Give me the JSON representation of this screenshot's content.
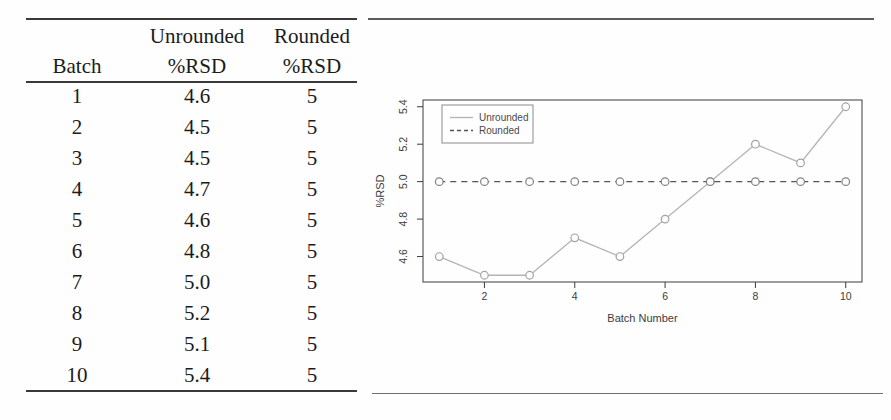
{
  "table": {
    "header": {
      "batch": "Batch",
      "unrounded_line1": "Unrounded",
      "unrounded_line2": "%RSD",
      "rounded_line1": "Rounded",
      "rounded_line2": "%RSD"
    },
    "rows": [
      {
        "batch": "1",
        "unrounded": "4.6",
        "rounded": "5"
      },
      {
        "batch": "2",
        "unrounded": "4.5",
        "rounded": "5"
      },
      {
        "batch": "3",
        "unrounded": "4.5",
        "rounded": "5"
      },
      {
        "batch": "4",
        "unrounded": "4.7",
        "rounded": "5"
      },
      {
        "batch": "5",
        "unrounded": "4.6",
        "rounded": "5"
      },
      {
        "batch": "6",
        "unrounded": "4.8",
        "rounded": "5"
      },
      {
        "batch": "7",
        "unrounded": "5.0",
        "rounded": "5"
      },
      {
        "batch": "8",
        "unrounded": "5.2",
        "rounded": "5"
      },
      {
        "batch": "9",
        "unrounded": "5.1",
        "rounded": "5"
      },
      {
        "batch": "10",
        "unrounded": "5.4",
        "rounded": "5"
      }
    ]
  },
  "chart_data": {
    "type": "line",
    "title": "",
    "xlabel": "Batch Number",
    "ylabel": "%RSD",
    "x": [
      1,
      2,
      3,
      4,
      5,
      6,
      7,
      8,
      9,
      10
    ],
    "series": [
      {
        "name": "Unrounded",
        "values": [
          4.6,
          4.5,
          4.5,
          4.7,
          4.6,
          4.8,
          5.0,
          5.2,
          5.1,
          5.4
        ],
        "line_style": "solid",
        "color": "#b4b4b4",
        "marker_color": "#a2a2a2"
      },
      {
        "name": "Rounded",
        "values": [
          5.0,
          5.0,
          5.0,
          5.0,
          5.0,
          5.0,
          5.0,
          5.0,
          5.0,
          5.0
        ],
        "line_style": "dashed",
        "color": "#555555",
        "marker_color": "#828282"
      }
    ],
    "marker": "open-circle",
    "x_tick_labels": [
      "2",
      "4",
      "6",
      "8",
      "10"
    ],
    "y_tick_labels": [
      "4.6",
      "4.8",
      "5.0",
      "5.2",
      "5.4"
    ],
    "xlim": [
      0.64,
      10.36
    ],
    "ylim": [
      4.464,
      5.436
    ],
    "grid": false,
    "legend": {
      "position": "top-left",
      "entries": [
        "Unrounded",
        "Rounded"
      ]
    },
    "axis_color": "#3c3c3c"
  }
}
